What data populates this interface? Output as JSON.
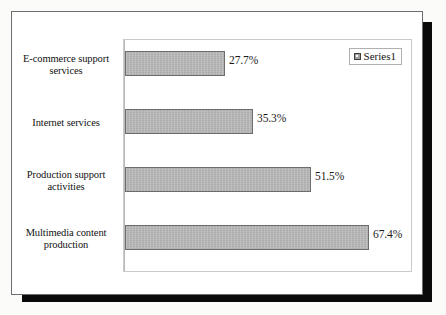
{
  "figure": {
    "legend": {
      "swatch_icon": "legend-square-icon",
      "label": "Series1",
      "swatch_color": "#9e9e9e"
    },
    "bar_fill_color": "#b3b3b3",
    "bar_border_color": "#6d6d6d",
    "plot_border_color": "#c9c9c9",
    "card_border_color": "#6e6e6e",
    "shadow_color": "#0a0a0a"
  },
  "chart_data": {
    "type": "bar",
    "orientation": "horizontal",
    "title": "",
    "xlabel": "",
    "ylabel": "",
    "grid": false,
    "legend_position": "top-right",
    "xlim": [
      0,
      80
    ],
    "categories": [
      "E-commerce support services",
      "Internet services",
      "Production support activities",
      "Multimedia content production"
    ],
    "category_lines": [
      [
        "E-commerce support",
        "services"
      ],
      [
        "Internet services"
      ],
      [
        "Production support",
        "activities"
      ],
      [
        "Multimedia content",
        "production"
      ]
    ],
    "values": [
      27.7,
      35.3,
      51.5,
      67.4
    ],
    "value_labels": [
      "27.7%",
      "35.3%",
      "51.5%",
      "67.4%"
    ],
    "series": [
      {
        "name": "Series1",
        "values": [
          27.7,
          35.3,
          51.5,
          67.4
        ]
      }
    ]
  }
}
